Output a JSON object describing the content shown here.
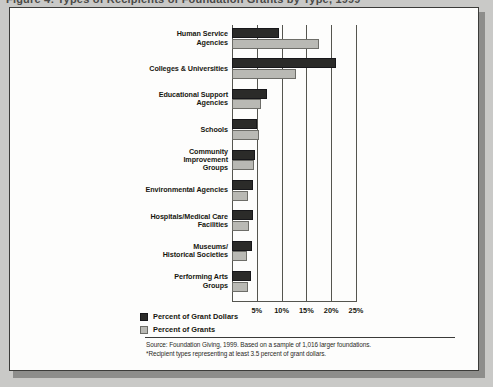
{
  "figure": {
    "title_cropped": "Figure 4: Types of Recipients of Foundation Grants by Type, 1999"
  },
  "legend": {
    "position": "bottom-left",
    "items": [
      {
        "label": "Percent of Grant Dollars",
        "color": "#2b2b29",
        "key": "dollars"
      },
      {
        "label": "Percent of Grants",
        "color": "#b9b9b4",
        "key": "grants"
      }
    ]
  },
  "source": {
    "line1": "Source: Foundation Giving, 1999. Based on a sample of 1,016 larger foundations.",
    "line2": "*Recipient types representing at least 3.5 percent of grant dollars."
  },
  "chart_data": {
    "type": "bar",
    "orientation": "horizontal",
    "title": "",
    "xlabel": "",
    "ylabel": "",
    "xlim": [
      0,
      25
    ],
    "xticks": [
      5,
      10,
      15,
      20,
      25
    ],
    "xtick_labels": [
      "5%",
      "10%",
      "15%",
      "20%",
      "25%"
    ],
    "grid": true,
    "legend_position": "bottom-left",
    "categories": [
      "Human Service\nAgencies",
      "Colleges & Universities",
      "Educational Support\nAgencies",
      "Schools",
      "Community\nImprovement\nGroups",
      "Environmental Agencies",
      "Hospitals/Medical Care\nFacilities",
      "Museums/\nHistorical Societies",
      "Performing Arts\nGroups"
    ],
    "series": [
      {
        "name": "Percent of Grant Dollars",
        "color": "#2b2b29",
        "values": [
          9.5,
          21.0,
          7.0,
          5.0,
          4.6,
          4.2,
          4.2,
          4.0,
          3.8
        ]
      },
      {
        "name": "Percent of Grants",
        "color": "#b9b9b4",
        "values": [
          17.5,
          13.0,
          5.8,
          5.5,
          4.5,
          3.2,
          3.5,
          3.0,
          3.3
        ]
      }
    ]
  }
}
